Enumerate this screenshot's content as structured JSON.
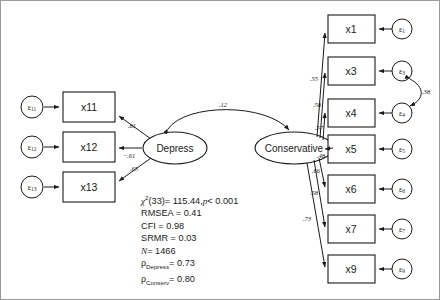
{
  "diagram": {
    "type": "structural-equation-model",
    "factors": [
      {
        "id": "depress",
        "label": "Depress",
        "cx": 174,
        "cy": 147,
        "rx": 32,
        "ry": 16
      },
      {
        "id": "conservative",
        "label": "Conservative",
        "cx": 293,
        "cy": 147,
        "rx": 39,
        "ry": 16
      }
    ],
    "left_indicators": [
      {
        "id": "x11",
        "label": "x11",
        "error": "ε",
        "error_sub": "11",
        "loading": ".81",
        "bx": 62,
        "by": 91,
        "bw": 52,
        "bh": 30
      },
      {
        "id": "x12",
        "label": "x12",
        "error": "ε",
        "error_sub": "12",
        "loading": "−.61",
        "bx": 62,
        "by": 131,
        "bw": 52,
        "bh": 30
      },
      {
        "id": "x13",
        "label": "x13",
        "error": "ε",
        "error_sub": "13",
        "loading": ".65",
        "bx": 62,
        "by": 171,
        "bw": 52,
        "bh": 30
      }
    ],
    "right_indicators": [
      {
        "id": "x1",
        "label": "x1",
        "error": "ε",
        "error_sub": "1",
        "loading": ".55",
        "bx": 327,
        "by": 14,
        "bw": 47,
        "bh": 28
      },
      {
        "id": "x3",
        "label": "x3",
        "error": "ε",
        "error_sub": "3",
        "loading": ".58",
        "bx": 327,
        "by": 56,
        "bw": 47,
        "bh": 28
      },
      {
        "id": "x4",
        "label": "x4",
        "error": "ε",
        "error_sub": "4",
        "loading": ".57",
        "bx": 327,
        "by": 98,
        "bw": 47,
        "bh": 28
      },
      {
        "id": "x5",
        "label": "x5",
        "error": "ε",
        "error_sub": "5",
        "loading": ".48",
        "bx": 327,
        "by": 134,
        "bw": 47,
        "bh": 28
      },
      {
        "id": "x6",
        "label": "x6",
        "error": "ε",
        "error_sub": "6",
        "loading": ".66",
        "bx": 327,
        "by": 174,
        "bw": 47,
        "bh": 28
      },
      {
        "id": "x7",
        "label": "x7",
        "error": "ε",
        "error_sub": "7",
        "loading": ".58",
        "bx": 327,
        "by": 214,
        "bw": 47,
        "bh": 28
      },
      {
        "id": "x9",
        "label": "x9",
        "error": "ε",
        "error_sub": "9",
        "loading": ".73",
        "bx": 327,
        "by": 254,
        "bw": 47,
        "bh": 28
      }
    ],
    "factor_covariance": {
      "label": ".12",
      "from": "depress",
      "to": "conservative"
    },
    "error_covariance": {
      "label": ".38",
      "from": "ε3",
      "to": "ε4"
    }
  },
  "fit_statistics": {
    "chi_square_symbol": "χ",
    "chi_square_sup": "2",
    "chi_square_df": "(33)",
    "chi_square_eq": "= 115.44,",
    "p_symbol": "p",
    "p_value": "< 0.001",
    "rmsea": "RMSEA = 0.41",
    "cfi": "CFI = 0.98",
    "srmr": "SRMR = 0.03",
    "n_symbol": "N",
    "n_value": "= 1466",
    "rho_symbol": "ρ",
    "rho_depress_sub": "Depress",
    "rho_depress_value": "= 0.73",
    "rho_conserv_sub": "Conserv",
    "rho_conserv_value": "= 0.80"
  }
}
